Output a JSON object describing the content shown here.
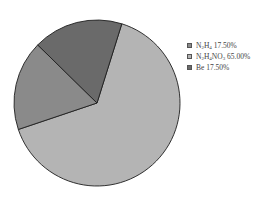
{
  "chart_data": {
    "type": "pie",
    "title": "",
    "categories": [
      "N2H4",
      "N2H4NO3",
      "Be"
    ],
    "values": [
      17.5,
      65.0,
      17.5
    ],
    "unit": "%",
    "colors": [
      "#8a8a8a",
      "#b4b4b4",
      "#6a6a6a"
    ],
    "legend": {
      "position": "right",
      "entries": [
        {
          "label": "N2H4 17.50%",
          "color": "#8a8a8a"
        },
        {
          "label": "N2H4NO3 65.00%",
          "color": "#b4b4b4"
        },
        {
          "label": "Be 17.50%",
          "color": "#6a6a6a"
        }
      ]
    }
  },
  "legend": {
    "items": [
      {
        "formula_parts": [
          "N",
          "2",
          "H",
          "4",
          ""
        ],
        "value": "17.50%",
        "color": "#8a8a8a"
      },
      {
        "formula_parts": [
          "N",
          "2",
          "H",
          "4",
          "NO",
          "3"
        ],
        "value": "65.00%",
        "color": "#b4b4b4"
      },
      {
        "formula_parts": [
          "Be"
        ],
        "value": "17.50%",
        "color": "#6a6a6a"
      }
    ]
  }
}
